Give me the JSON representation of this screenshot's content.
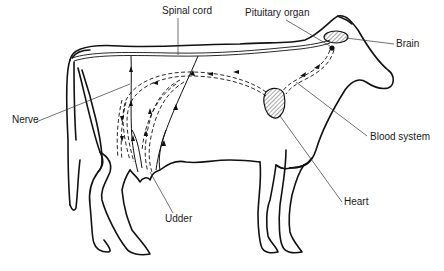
{
  "diagram": {
    "labels": {
      "spinal_cord": "Spinal cord",
      "pituitary_organ": "Pituitary organ",
      "brain": "Brain",
      "nerve": "Nerve",
      "blood_system": "Blood system",
      "heart": "Heart",
      "udder": "Udder"
    },
    "colors": {
      "line": "#111111",
      "background": "#ffffff",
      "text": "#1a1a1a"
    }
  }
}
